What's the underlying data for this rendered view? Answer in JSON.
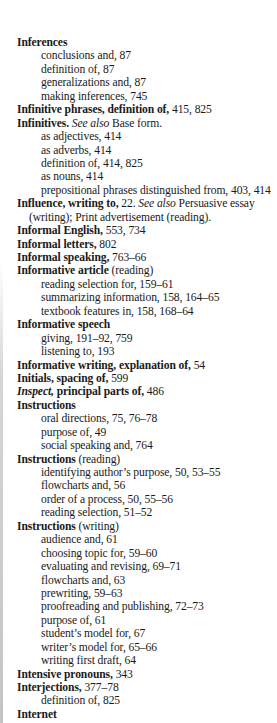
{
  "index": {
    "lines": [
      {
        "type": "main",
        "term": "Inferences",
        "rest": ""
      },
      {
        "type": "sub",
        "text": "conclusions and, 87"
      },
      {
        "type": "sub",
        "text": "definition of, 87"
      },
      {
        "type": "sub",
        "text": "generalizations and, 87"
      },
      {
        "type": "sub",
        "text": "making inferences, 745"
      },
      {
        "type": "main",
        "term": "Infinitive phrases, definition of,",
        "rest": " 415, 825"
      },
      {
        "type": "main-see",
        "term": "Infinitives.",
        "see": " See also",
        "rest": " Base form."
      },
      {
        "type": "sub",
        "text": "as adjectives, 414"
      },
      {
        "type": "sub",
        "text": "as adverbs, 414"
      },
      {
        "type": "sub",
        "text": "definition of, 414, 825"
      },
      {
        "type": "sub",
        "text": "as nouns, 414"
      },
      {
        "type": "sub",
        "text": "prepositional phrases distinguished from, 403, 414"
      },
      {
        "type": "main-see",
        "term": "Influence, writing to,",
        "pre": " 22.",
        "see": " See also",
        "rest": " Persuasive essay"
      },
      {
        "type": "cont",
        "text": "(writing); Print advertisement (reading)."
      },
      {
        "type": "main",
        "term": "Informal English,",
        "rest": " 553, 734"
      },
      {
        "type": "main",
        "term": "Informal letters,",
        "rest": " 802"
      },
      {
        "type": "main",
        "term": "Informal speaking,",
        "rest": " 763–66"
      },
      {
        "type": "main",
        "term": "Informative article",
        "rest": " (reading)"
      },
      {
        "type": "sub",
        "text": "reading selection for, 159–61"
      },
      {
        "type": "sub",
        "text": "summarizing information, 158, 164–65"
      },
      {
        "type": "sub",
        "text": "textbook features in, 158, 168–64"
      },
      {
        "type": "main",
        "term": "Informative speech",
        "rest": ""
      },
      {
        "type": "sub",
        "text": "giving, 191–92, 759"
      },
      {
        "type": "sub",
        "text": "listening to, 193"
      },
      {
        "type": "main",
        "term": "Informative writing, explanation of,",
        "rest": " 54"
      },
      {
        "type": "main",
        "term": "Initials, spacing of,",
        "rest": " 599"
      },
      {
        "type": "main-italic",
        "italic": "Inspect,",
        "term": " principal parts of,",
        "rest": " 486"
      },
      {
        "type": "main",
        "term": "Instructions",
        "rest": ""
      },
      {
        "type": "sub",
        "text": "oral directions, 75, 76–78"
      },
      {
        "type": "sub",
        "text": "purpose of, 49"
      },
      {
        "type": "sub",
        "text": "social speaking and, 764"
      },
      {
        "type": "main",
        "term": "Instructions",
        "rest": " (reading)"
      },
      {
        "type": "sub",
        "text": "identifying author’s purpose, 50, 53–55"
      },
      {
        "type": "sub",
        "text": "flowcharts and, 56"
      },
      {
        "type": "sub",
        "text": "order of a process, 50, 55–56"
      },
      {
        "type": "sub",
        "text": "reading selection, 51–52"
      },
      {
        "type": "main",
        "term": "Instructions",
        "rest": " (writing)"
      },
      {
        "type": "sub",
        "text": "audience and, 61"
      },
      {
        "type": "sub",
        "text": "choosing topic for, 59–60"
      },
      {
        "type": "sub",
        "text": "evaluating and revising, 69–71"
      },
      {
        "type": "sub",
        "text": "flowcharts and, 63"
      },
      {
        "type": "sub",
        "text": "prewriting, 59–63"
      },
      {
        "type": "sub",
        "text": "proofreading and publishing, 72–73"
      },
      {
        "type": "sub",
        "text": "purpose of, 61"
      },
      {
        "type": "sub",
        "text": "student’s model for, 67"
      },
      {
        "type": "sub",
        "text": "writer’s model for, 65–66"
      },
      {
        "type": "sub",
        "text": "writing first draft, 64"
      },
      {
        "type": "main",
        "term": "Intensive pronouns,",
        "rest": " 343"
      },
      {
        "type": "main",
        "term": "Interjections,",
        "rest": " 377–78"
      },
      {
        "type": "sub",
        "text": "definition of, 825"
      },
      {
        "type": "main",
        "term": "Internet",
        "rest": ""
      }
    ]
  }
}
